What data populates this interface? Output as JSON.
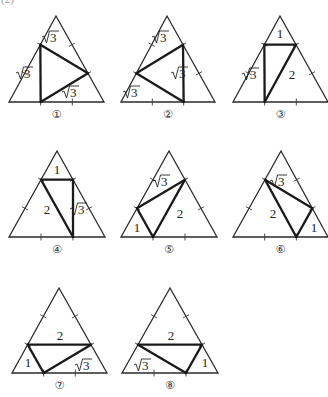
{
  "corner_label": "(2)",
  "figures": [
    {
      "id": 1,
      "caption": "①",
      "apex": [
        56,
        16
      ],
      "base_left": [
        9,
        102
      ],
      "base_right": [
        104,
        102
      ],
      "cuts": [
        [
          "AB1",
          "BC1"
        ],
        [
          "AB1",
          "AC2"
        ],
        [
          "BC1",
          "AC2"
        ]
      ],
      "labels": [
        {
          "text": "√3",
          "pos": [
            52,
            42
          ]
        },
        {
          "text": "√3",
          "pos": [
            26,
            78
          ]
        },
        {
          "text": "√3",
          "pos": [
            72,
            97
          ]
        }
      ]
    },
    {
      "id": 2,
      "caption": "②",
      "apex": [
        167,
        16
      ],
      "base_left": [
        121,
        102
      ],
      "base_right": [
        215,
        102
      ],
      "cuts": [
        [
          "AC1",
          "BC2"
        ],
        [
          "AC1",
          "AB2"
        ],
        [
          "AB2",
          "BC2"
        ]
      ],
      "labels": [
        {
          "text": "√3",
          "pos": [
            162,
            42
          ]
        },
        {
          "text": "√3",
          "pos": [
            181,
            78
          ]
        },
        {
          "text": "√3",
          "pos": [
            133,
            97
          ]
        }
      ]
    },
    {
      "id": 3,
      "caption": "③",
      "apex": [
        280,
        16
      ],
      "base_left": [
        233,
        102
      ],
      "base_right": [
        328,
        102
      ],
      "cuts": [
        [
          "AB1",
          "AC1"
        ],
        [
          "AB1",
          "BC1"
        ],
        [
          "AC1",
          "BC1"
        ]
      ],
      "labels": [
        {
          "text": "1",
          "pos": [
            280,
            38
          ]
        },
        {
          "text": "√3",
          "pos": [
            252,
            79
          ]
        },
        {
          "text": "2",
          "pos": [
            292,
            79
          ]
        }
      ]
    },
    {
      "id": 4,
      "caption": "④",
      "apex": [
        57,
        151
      ],
      "base_left": [
        9,
        237
      ],
      "base_right": [
        105,
        237
      ],
      "cuts": [
        [
          "AB1",
          "AC1"
        ],
        [
          "AB1",
          "BC2"
        ],
        [
          "AC1",
          "BC2"
        ]
      ],
      "labels": [
        {
          "text": "1",
          "pos": [
            57,
            174
          ]
        },
        {
          "text": "2",
          "pos": [
            47,
            214
          ]
        },
        {
          "text": "√3",
          "pos": [
            80,
            214
          ]
        }
      ]
    },
    {
      "id": 5,
      "caption": "⑤",
      "apex": [
        169,
        151
      ],
      "base_left": [
        121,
        237
      ],
      "base_right": [
        217,
        237
      ],
      "cuts": [
        [
          "AB2",
          "AC1"
        ],
        [
          "AB2",
          "BC1"
        ],
        [
          "BC1",
          "AC1"
        ]
      ],
      "labels": [
        {
          "text": "√3",
          "pos": [
            163,
            186
          ]
        },
        {
          "text": "1",
          "pos": [
            137,
            232
          ]
        },
        {
          "text": "2",
          "pos": [
            180,
            218
          ]
        }
      ]
    },
    {
      "id": 6,
      "caption": "⑥",
      "apex": [
        281,
        151
      ],
      "base_left": [
        233,
        237
      ],
      "base_right": [
        328,
        237
      ],
      "cuts": [
        [
          "AB1",
          "AC2"
        ],
        [
          "AB1",
          "BC2"
        ],
        [
          "BC2",
          "AC2"
        ]
      ],
      "labels": [
        {
          "text": "√3",
          "pos": [
            280,
            186
          ]
        },
        {
          "text": "2",
          "pos": [
            273,
            218
          ]
        },
        {
          "text": "1",
          "pos": [
            314,
            232
          ]
        }
      ]
    },
    {
      "id": 7,
      "caption": "⑦",
      "apex": [
        59,
        288
      ],
      "base_left": [
        12,
        373
      ],
      "base_right": [
        107,
        373
      ],
      "cuts": [
        [
          "AB2",
          "AC2"
        ],
        [
          "AB2",
          "BC1"
        ],
        [
          "BC1",
          "AC2"
        ]
      ],
      "labels": [
        {
          "text": "2",
          "pos": [
            60,
            340
          ]
        },
        {
          "text": "1",
          "pos": [
            28,
            367
          ]
        },
        {
          "text": "√3",
          "pos": [
            85,
            370
          ]
        }
      ]
    },
    {
      "id": 8,
      "caption": "⑧",
      "apex": [
        170,
        288
      ],
      "base_left": [
        122,
        373
      ],
      "base_right": [
        218,
        373
      ],
      "cuts": [
        [
          "AB2",
          "AC2"
        ],
        [
          "AB2",
          "BC2"
        ],
        [
          "BC2",
          "AC2"
        ]
      ],
      "labels": [
        {
          "text": "2",
          "pos": [
            171,
            340
          ]
        },
        {
          "text": "√3",
          "pos": [
            144,
            370
          ]
        },
        {
          "text": "1",
          "pos": [
            205,
            367
          ]
        }
      ]
    }
  ]
}
